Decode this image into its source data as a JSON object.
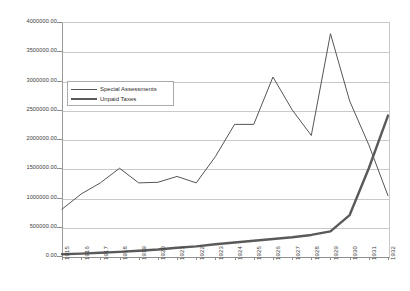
{
  "chart_data": {
    "type": "line",
    "title": "",
    "xlabel": "",
    "ylabel": "",
    "grid": true,
    "legend_position": "inside-upper-left",
    "ylim": [
      0,
      4000000
    ],
    "ytick_step": 500000,
    "ytick_labels": [
      "4000000.00",
      "3500000.00",
      "3000000.00",
      "2500000.00",
      "2000000.00",
      "1500000.00",
      "1000000.00",
      "500000.00",
      "0.00"
    ],
    "ytick_values": [
      4000000,
      3500000,
      3000000,
      2500000,
      2000000,
      1500000,
      1000000,
      500000,
      0
    ],
    "categories": [
      "1915",
      "1916",
      "1917",
      "1918",
      "1919",
      "1920",
      "1921",
      "1922",
      "1923",
      "1924",
      "1925",
      "1926",
      "1927",
      "1928",
      "1929",
      "1930",
      "1931",
      "1932"
    ],
    "series": [
      {
        "name": "Special Assessments",
        "color": "#555555",
        "width": 1,
        "values": [
          800000,
          1060000,
          1250000,
          1500000,
          1250000,
          1260000,
          1360000,
          1250000,
          1700000,
          2250000,
          2250000,
          3060000,
          2500000,
          2060000,
          3800000,
          2650000,
          1900000,
          1030000
        ]
      },
      {
        "name": "Unpaid Taxes",
        "color": "#5a5a5a",
        "width": 2.4,
        "values": [
          30000,
          40000,
          55000,
          70000,
          90000,
          110000,
          140000,
          165000,
          200000,
          230000,
          260000,
          290000,
          320000,
          360000,
          420000,
          700000,
          1500000,
          2400000
        ]
      }
    ]
  },
  "legend": {
    "items": [
      {
        "label": "Special Assessments",
        "style": "thin"
      },
      {
        "label": "Unpaid Taxes",
        "style": "thick"
      }
    ]
  }
}
